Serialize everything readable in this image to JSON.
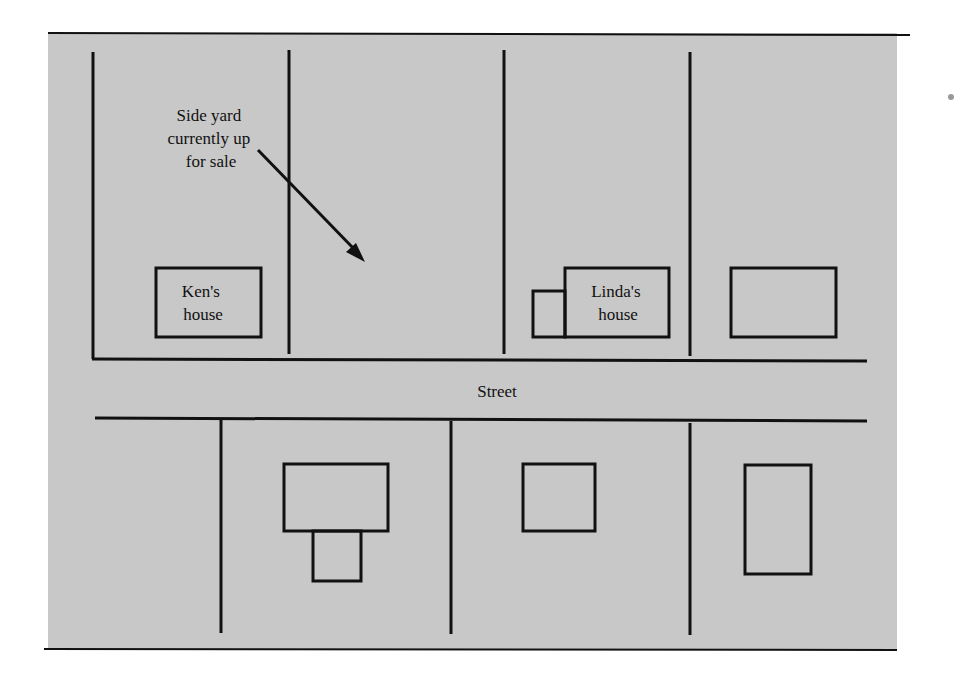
{
  "diagram": {
    "background": "#c8c8c8",
    "line_color": "#111111",
    "annotation": {
      "lines": [
        "Side yard",
        "currently up",
        "for sale"
      ]
    },
    "houses": {
      "ken": {
        "lines": [
          "Ken's",
          "house"
        ]
      },
      "linda": {
        "lines": [
          "Linda's",
          "house"
        ]
      }
    },
    "street_label": "Street"
  }
}
